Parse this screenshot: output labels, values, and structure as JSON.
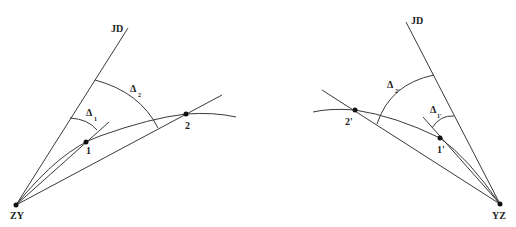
{
  "diagram": {
    "left": {
      "start_point_label": "ZY",
      "intersection_label": "JD",
      "points": [
        {
          "label": "1"
        },
        {
          "label": "2"
        }
      ],
      "angles": [
        {
          "symbol": "Δ",
          "subscript": "1"
        },
        {
          "symbol": "Δ",
          "subscript": "2"
        }
      ]
    },
    "right": {
      "start_point_label": "YZ",
      "intersection_label": "JD",
      "points": [
        {
          "label": "1'"
        },
        {
          "label": "2'"
        }
      ],
      "angles": [
        {
          "symbol": "Δ",
          "subscript": "1'"
        },
        {
          "symbol": "Δ",
          "subscript": "2'"
        }
      ]
    }
  }
}
